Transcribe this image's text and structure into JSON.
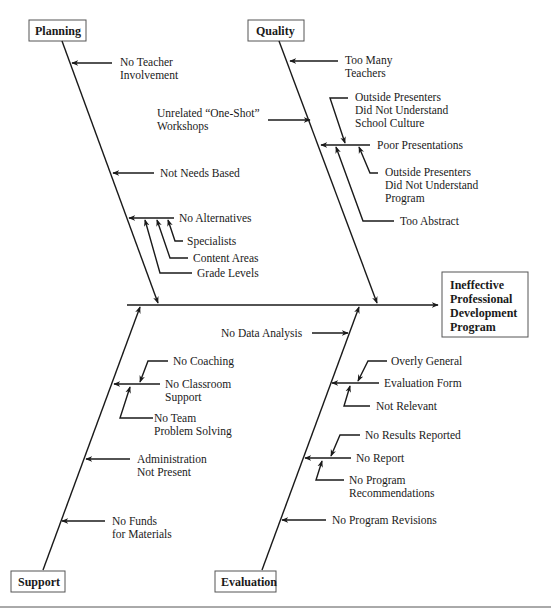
{
  "effect": {
    "lines": [
      "Ineffective",
      "Professional",
      "Development",
      "Program"
    ]
  },
  "categories": {
    "planning": "Planning",
    "quality": "Quality",
    "support": "Support",
    "evaluation": "Evaluation"
  },
  "planning_causes": {
    "no_teacher_involvement": [
      "No Teacher",
      "Involvement"
    ],
    "not_needs_based": "Not Needs Based",
    "no_alternatives": "No Alternatives",
    "specialists": "Specialists",
    "content_areas": "Content Areas",
    "grade_levels": "Grade Levels"
  },
  "quality_causes": {
    "too_many_teachers": [
      "Too Many",
      "Teachers"
    ],
    "unrelated_workshops": [
      "Unrelated “One-Shot”",
      "Workshops"
    ],
    "outside_presenters_culture": [
      "Outside Presenters",
      "Did Not Understand",
      "School Culture"
    ],
    "poor_presentations": "Poor Presentations",
    "outside_presenters_program": [
      "Outside Presenters",
      "Did Not Understand",
      "Program"
    ],
    "too_abstract": "Too Abstract"
  },
  "support_causes": {
    "no_coaching": "No Coaching",
    "no_classroom_support": [
      "No Classroom",
      "Support"
    ],
    "no_team_problem_solving": [
      "No Team",
      "Problem Solving"
    ],
    "administration_not_present": [
      "Administration",
      "Not Present"
    ],
    "no_funds": [
      "No Funds",
      "for Materials"
    ]
  },
  "evaluation_causes": {
    "no_data_analysis": "No Data Analysis",
    "overly_general": "Overly General",
    "evaluation_form": "Evaluation Form",
    "not_relevant": "Not Relevant",
    "no_results_reported": "No Results Reported",
    "no_report": "No Report",
    "no_program_recommendations": [
      "No Program",
      "Recommendations"
    ],
    "no_program_revisions": "No Program Revisions"
  },
  "colors": {
    "line": "#1a1a1a",
    "box_border": "#555555",
    "background": "#ffffff"
  }
}
